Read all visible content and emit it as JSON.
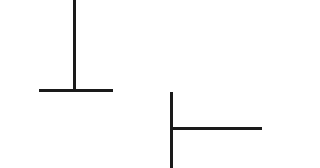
{
  "diagram": {
    "background": "#ffffff",
    "stroke_color": "#1a1a1a",
    "shapes": [
      {
        "name": "inverted-t-shape",
        "lines": [
          {
            "orientation": "vertical",
            "x": 73,
            "y": 0,
            "width": 2.5,
            "height": 90
          },
          {
            "orientation": "horizontal",
            "x": 39,
            "y": 89,
            "width": 74,
            "height": 2.5
          }
        ]
      },
      {
        "name": "sideways-t-shape",
        "lines": [
          {
            "orientation": "vertical",
            "x": 170,
            "y": 92,
            "width": 2.5,
            "height": 76
          },
          {
            "orientation": "horizontal",
            "x": 172,
            "y": 127,
            "width": 90,
            "height": 2.5
          }
        ]
      }
    ]
  }
}
